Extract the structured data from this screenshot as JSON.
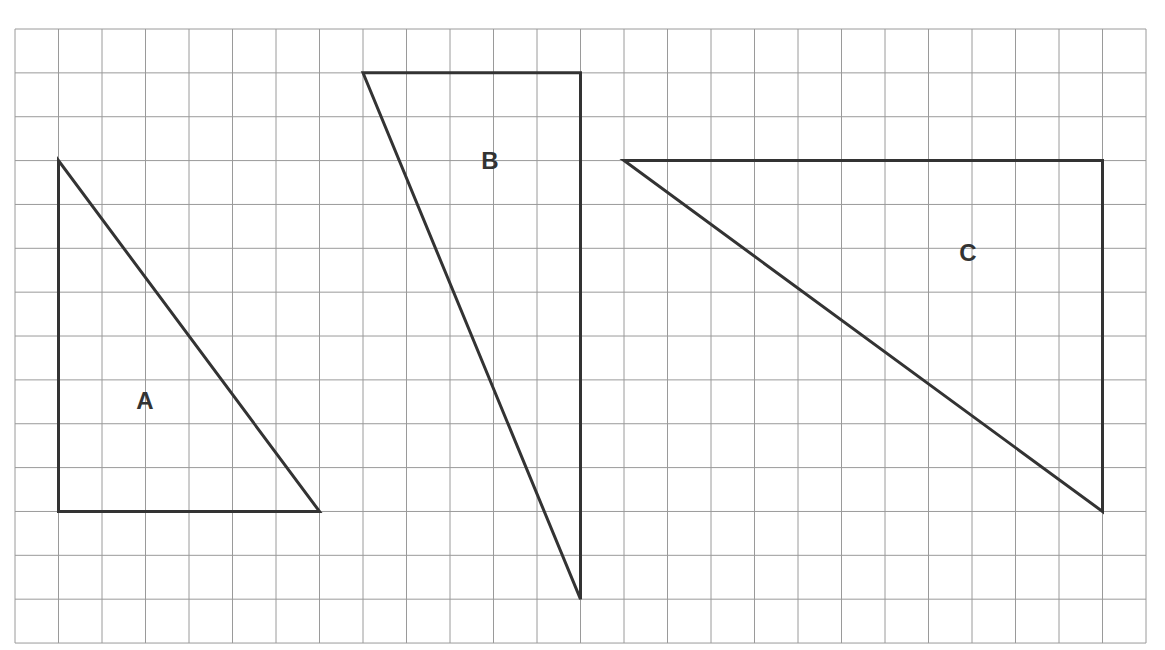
{
  "title_partial": "Triangles drawn on a grid (cut off)",
  "grid": {
    "x0": 15,
    "y0": 29,
    "cols": 26,
    "rows": 14,
    "cell_w": 43.5,
    "cell_h": 43.86,
    "line_color": "#9a9a9a"
  },
  "shape_color": "#333333",
  "triangles": [
    {
      "label": "A",
      "vertices": [
        [
          1,
          3
        ],
        [
          1,
          11
        ],
        [
          7,
          11
        ]
      ],
      "label_pos": [
        145,
        400
      ]
    },
    {
      "label": "B",
      "vertices": [
        [
          8,
          1
        ],
        [
          13,
          1
        ],
        [
          13,
          13
        ]
      ],
      "label_pos": [
        490,
        160
      ]
    },
    {
      "label": "C",
      "vertices": [
        [
          14,
          3
        ],
        [
          25,
          3
        ],
        [
          25,
          11
        ]
      ],
      "label_pos": [
        968,
        252
      ]
    }
  ]
}
